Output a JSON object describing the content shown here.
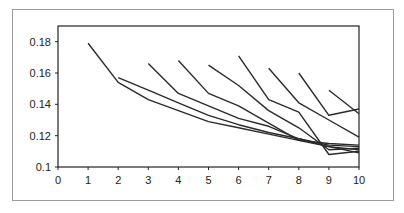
{
  "chart_data": {
    "type": "line",
    "title": "",
    "xlabel": "",
    "ylabel": "",
    "x": [
      0,
      1,
      2,
      3,
      4,
      5,
      6,
      7,
      8,
      9,
      10
    ],
    "xlim": [
      0,
      10
    ],
    "ylim": [
      0.1,
      0.19
    ],
    "xticks": [
      "0",
      "1",
      "2",
      "3",
      "4",
      "5",
      "6",
      "7",
      "8",
      "9",
      "10"
    ],
    "yticks": [
      "0.1",
      "0.12",
      "0.14",
      "0.16",
      "0.18"
    ],
    "grid": false,
    "legend": null,
    "line_color": "#2a2a2a",
    "series": [
      {
        "name": "start 1",
        "x": [
          1,
          2,
          3,
          4,
          5,
          6,
          7,
          8,
          9,
          10
        ],
        "values": [
          0.179,
          0.154,
          0.143,
          0.136,
          0.129,
          0.125,
          0.121,
          0.117,
          0.115,
          0.114
        ]
      },
      {
        "name": "start 2",
        "x": [
          2,
          3,
          4,
          5,
          6,
          7,
          8,
          9,
          10
        ],
        "values": [
          0.157,
          0.149,
          0.141,
          0.133,
          0.127,
          0.122,
          0.118,
          0.114,
          0.113
        ]
      },
      {
        "name": "start 3",
        "x": [
          3,
          4,
          5,
          6,
          7,
          8,
          9,
          10
        ],
        "values": [
          0.166,
          0.147,
          0.139,
          0.131,
          0.126,
          0.118,
          0.113,
          0.111
        ]
      },
      {
        "name": "start 4",
        "x": [
          4,
          5,
          6,
          7,
          8,
          9,
          10
        ],
        "values": [
          0.168,
          0.147,
          0.139,
          0.128,
          0.117,
          0.113,
          0.109
        ]
      },
      {
        "name": "start 5",
        "x": [
          5,
          6,
          7,
          8,
          9,
          10
        ],
        "values": [
          0.165,
          0.152,
          0.136,
          0.125,
          0.111,
          0.112
        ]
      },
      {
        "name": "start 6",
        "x": [
          6,
          7,
          8,
          9,
          10
        ],
        "values": [
          0.171,
          0.143,
          0.135,
          0.108,
          0.11
        ]
      },
      {
        "name": "start 7",
        "x": [
          7,
          8,
          9,
          10
        ],
        "values": [
          0.163,
          0.141,
          0.13,
          0.119
        ]
      },
      {
        "name": "start 8",
        "x": [
          8,
          9,
          10
        ],
        "values": [
          0.16,
          0.133,
          0.137
        ]
      },
      {
        "name": "start 9",
        "x": [
          9,
          10
        ],
        "values": [
          0.149,
          0.134
        ]
      }
    ]
  }
}
